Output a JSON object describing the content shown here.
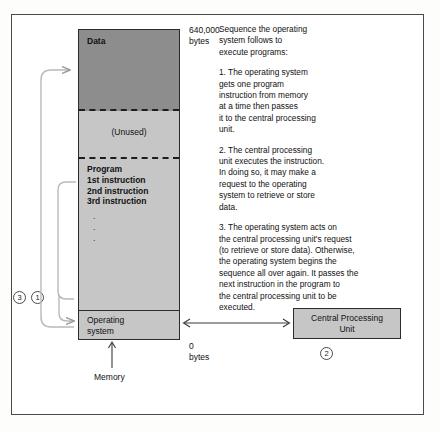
{
  "figure": {
    "memory": {
      "caption": "Memory",
      "top_bytes": "640,000\nbytes",
      "bottom_bytes": "0\nbytes",
      "segments": [
        {
          "id": "data",
          "label": "Data",
          "fill": "#8d8d8d"
        },
        {
          "id": "unused",
          "label": "(Unused)",
          "fill": "#c6c6c6"
        },
        {
          "id": "program",
          "label": "Program\n1st instruction\n2nd instruction\n3rd instruction",
          "dots": ".\n.\n.",
          "fill": "#c6c6c6"
        },
        {
          "id": "operating-system",
          "label": "Operating\nsystem",
          "fill": "#c6c6c6"
        }
      ]
    },
    "cpu": {
      "label": "Central Processing\nUnit",
      "step_number": "2"
    },
    "steps": {
      "three": "3",
      "one": "1"
    },
    "explanation": {
      "intro": "Sequence the operating\nsystem follows to\nexecute programs:",
      "items": [
        "1.   The operating system\ngets one program\ninstruction from memory\nat a time then passes\nit to the central processing\nunit.",
        "2.   The central processing\nunit executes the instruction.\nIn doing so, it may make a\nrequest to the operating\nsystem to retrieve or store\ndata.",
        "3.   The operating system acts on\nthe central processing unit's request\n(to retrieve or  store data). Otherwise,\nthe operating system begins the\nsequence all over again. It passes the\nnext instruction in the program to\nthe central processing unit to be\nexecuted."
      ]
    },
    "colors": {
      "frame": "#4a4a4a",
      "outline": "#2b2b2b",
      "data_fill": "#8d8d8d",
      "block_fill": "#c6c6c6",
      "arrow": "#b9b9b9",
      "arrow_dark": "#3a3a3a"
    }
  }
}
